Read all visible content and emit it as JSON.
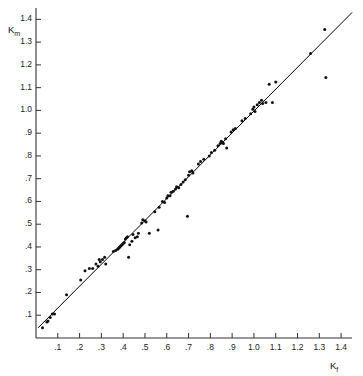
{
  "chart_data": {
    "type": "scatter",
    "title": "",
    "xlabel": "Kf",
    "ylabel": "Km",
    "xlabel_base": "K",
    "xlabel_sub": "f",
    "ylabel_base": "K",
    "ylabel_sub": "m",
    "xlim": [
      0.0,
      1.45
    ],
    "ylim": [
      0.0,
      1.45
    ],
    "grid": false,
    "legend": null,
    "xticks": [
      0.1,
      0.2,
      0.3,
      0.4,
      0.5,
      0.6,
      0.7,
      0.8,
      0.9,
      1.0,
      1.1,
      1.2,
      1.3,
      1.4
    ],
    "xtick_labels": [
      ".1",
      ".2",
      ".3",
      ".4",
      ".5",
      ".6",
      ".7",
      ".8",
      ".9",
      "1.0",
      "1.1",
      "1.2",
      "1.3",
      "1.4"
    ],
    "yticks": [
      0.1,
      0.2,
      0.3,
      0.4,
      0.5,
      0.6,
      0.7,
      0.8,
      0.9,
      1.0,
      1.1,
      1.2,
      1.3,
      1.4
    ],
    "ytick_labels": [
      ".1",
      ".2",
      ".3",
      ".4",
      ".5",
      ".6",
      ".7",
      ".8",
      ".9",
      "1.0",
      "1.1",
      "1.2",
      "1.3",
      "1.4"
    ],
    "line": {
      "name": "regression-line",
      "x": [
        0.01,
        1.45
      ],
      "y": [
        0.045,
        1.43
      ],
      "color": "#000000"
    },
    "marker_color": "#111111",
    "series": [
      {
        "name": "Km vs Kf",
        "points": [
          [
            0.03,
            0.045
          ],
          [
            0.05,
            0.07
          ],
          [
            0.055,
            0.075
          ],
          [
            0.065,
            0.09
          ],
          [
            0.075,
            0.105
          ],
          [
            0.085,
            0.105
          ],
          [
            0.14,
            0.19
          ],
          [
            0.205,
            0.255
          ],
          [
            0.225,
            0.295
          ],
          [
            0.245,
            0.305
          ],
          [
            0.26,
            0.305
          ],
          [
            0.275,
            0.325
          ],
          [
            0.285,
            0.315
          ],
          [
            0.29,
            0.345
          ],
          [
            0.295,
            0.335
          ],
          [
            0.305,
            0.345
          ],
          [
            0.315,
            0.355
          ],
          [
            0.32,
            0.325
          ],
          [
            0.355,
            0.38
          ],
          [
            0.365,
            0.385
          ],
          [
            0.375,
            0.39
          ],
          [
            0.38,
            0.395
          ],
          [
            0.385,
            0.4
          ],
          [
            0.39,
            0.405
          ],
          [
            0.395,
            0.41
          ],
          [
            0.4,
            0.415
          ],
          [
            0.405,
            0.42
          ],
          [
            0.41,
            0.435
          ],
          [
            0.415,
            0.44
          ],
          [
            0.42,
            0.445
          ],
          [
            0.425,
            0.355
          ],
          [
            0.43,
            0.41
          ],
          [
            0.44,
            0.425
          ],
          [
            0.445,
            0.455
          ],
          [
            0.455,
            0.44
          ],
          [
            0.465,
            0.445
          ],
          [
            0.47,
            0.46
          ],
          [
            0.485,
            0.505
          ],
          [
            0.49,
            0.52
          ],
          [
            0.5,
            0.515
          ],
          [
            0.505,
            0.51
          ],
          [
            0.52,
            0.46
          ],
          [
            0.545,
            0.555
          ],
          [
            0.56,
            0.475
          ],
          [
            0.565,
            0.575
          ],
          [
            0.58,
            0.6
          ],
          [
            0.59,
            0.595
          ],
          [
            0.6,
            0.615
          ],
          [
            0.605,
            0.625
          ],
          [
            0.615,
            0.625
          ],
          [
            0.62,
            0.64
          ],
          [
            0.63,
            0.645
          ],
          [
            0.64,
            0.655
          ],
          [
            0.645,
            0.665
          ],
          [
            0.655,
            0.66
          ],
          [
            0.665,
            0.675
          ],
          [
            0.675,
            0.685
          ],
          [
            0.685,
            0.695
          ],
          [
            0.695,
            0.535
          ],
          [
            0.7,
            0.715
          ],
          [
            0.705,
            0.73
          ],
          [
            0.715,
            0.735
          ],
          [
            0.72,
            0.725
          ],
          [
            0.745,
            0.765
          ],
          [
            0.755,
            0.775
          ],
          [
            0.77,
            0.785
          ],
          [
            0.795,
            0.8
          ],
          [
            0.805,
            0.815
          ],
          [
            0.82,
            0.825
          ],
          [
            0.835,
            0.845
          ],
          [
            0.845,
            0.855
          ],
          [
            0.85,
            0.865
          ],
          [
            0.855,
            0.86
          ],
          [
            0.86,
            0.855
          ],
          [
            0.87,
            0.875
          ],
          [
            0.875,
            0.835
          ],
          [
            0.895,
            0.905
          ],
          [
            0.905,
            0.915
          ],
          [
            0.915,
            0.92
          ],
          [
            0.945,
            0.955
          ],
          [
            0.96,
            0.965
          ],
          [
            0.985,
            0.985
          ],
          [
            0.995,
            1.005
          ],
          [
            1.0,
            1.015
          ],
          [
            1.005,
            0.995
          ],
          [
            1.015,
            1.025
          ],
          [
            1.025,
            1.035
          ],
          [
            1.035,
            1.045
          ],
          [
            1.04,
            1.03
          ],
          [
            1.055,
            1.035
          ],
          [
            1.07,
            1.115
          ],
          [
            1.085,
            1.035
          ],
          [
            1.1,
            1.125
          ],
          [
            1.26,
            1.25
          ],
          [
            1.325,
            1.355
          ],
          [
            1.33,
            1.145
          ]
        ]
      }
    ]
  },
  "axes": {
    "y_axis_title_top": "Km",
    "x_axis_title_right": "Kf"
  }
}
